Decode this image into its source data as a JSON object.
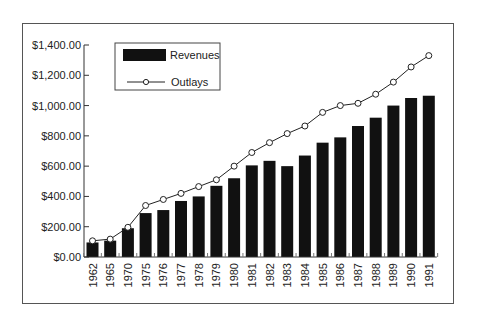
{
  "chart_data": {
    "type": "bar",
    "title": "",
    "xlabel": "",
    "ylabel": "",
    "ylim": [
      0,
      1400
    ],
    "yticks": [
      0,
      200,
      400,
      600,
      800,
      1000,
      1200,
      1400
    ],
    "ytick_labels": [
      "$0.00",
      "$200.00",
      "$400.00",
      "$600.00",
      "$800.00",
      "$1,000.00",
      "$1,200.00",
      "$1,400.00"
    ],
    "grid": false,
    "legend_position": "upper left",
    "categories": [
      "1962",
      "1965",
      "1970",
      "1975",
      "1976",
      "1977",
      "1978",
      "1979",
      "1980",
      "1981",
      "1982",
      "1983",
      "1984",
      "1985",
      "1986",
      "1987",
      "1988",
      "1989",
      "1990",
      "1991"
    ],
    "series": [
      {
        "name": "Revenues",
        "type": "bar",
        "color": "#111111",
        "values": [
          96,
          108,
          190,
          290,
          310,
          370,
          400,
          470,
          520,
          605,
          635,
          600,
          670,
          755,
          790,
          865,
          920,
          1000,
          1050,
          1065
        ]
      },
      {
        "name": "Outlays",
        "type": "line",
        "marker": "open-circle",
        "color": "#222222",
        "values": [
          107,
          118,
          196,
          340,
          380,
          420,
          465,
          510,
          600,
          690,
          755,
          815,
          865,
          955,
          1000,
          1015,
          1075,
          1155,
          1255,
          1330
        ]
      }
    ]
  },
  "legend": {
    "items": [
      {
        "label": "Revenues",
        "swatch": "bar"
      },
      {
        "label": "Outlays",
        "swatch": "line-circle"
      }
    ]
  }
}
